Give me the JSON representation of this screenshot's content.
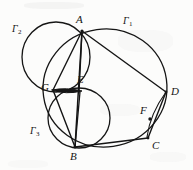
{
  "figure": {
    "kind": "euclidean-geometry-diagram",
    "background_color": "#fcfcfb",
    "stroke_color": "#151515",
    "width": 193,
    "height": 170,
    "points": {
      "A": {
        "x": 82,
        "y": 31,
        "label": "A",
        "label_x": 76,
        "label_y": 16
      },
      "B": {
        "x": 75,
        "y": 147,
        "label": "B",
        "label_x": 71,
        "label_y": 152
      },
      "C": {
        "x": 148,
        "y": 138,
        "label": "C",
        "label_x": 152,
        "label_y": 141
      },
      "D": {
        "x": 166,
        "y": 92,
        "label": "D",
        "label_x": 171,
        "label_y": 87
      },
      "E": {
        "x": 80,
        "y": 92,
        "label": "E",
        "label_x": 77,
        "label_y": 75
      },
      "F": {
        "x": 150,
        "y": 119,
        "label": "F",
        "label_x": 141,
        "label_y": 107
      },
      "G": {
        "x": 53,
        "y": 90,
        "label": "G",
        "label_x": 42,
        "label_y": 84
      }
    },
    "circles": {
      "Gamma1": {
        "cx": 105,
        "cy": 88,
        "rx": 62,
        "ry": 59,
        "rotation": -8,
        "label": "Γ",
        "subscript": "1",
        "label_x": 124,
        "label_y": 17
      },
      "Gamma2": {
        "cx": 56,
        "cy": 57,
        "rx": 34,
        "ry": 35,
        "rotation": 0,
        "label": "Γ",
        "subscript": "2",
        "label_x": 13,
        "label_y": 25
      },
      "Gamma3": {
        "cx": 79,
        "cy": 118,
        "rx": 31,
        "ry": 30,
        "rotation": 0,
        "label": "Γ",
        "subscript": "3",
        "label_x": 31,
        "label_y": 127
      }
    },
    "segments": [
      {
        "name": "A-B",
        "from": "A",
        "to": "B"
      },
      {
        "name": "A-D",
        "from": "A",
        "to": "D"
      },
      {
        "name": "A-G",
        "from": "A",
        "to": "G"
      },
      {
        "name": "A-E",
        "from": "A",
        "to": "E"
      },
      {
        "name": "B-G",
        "from": "B",
        "to": "G"
      },
      {
        "name": "B-E",
        "from": "B",
        "to": "E"
      },
      {
        "name": "B-C",
        "from": "B",
        "to": "C"
      },
      {
        "name": "C-D",
        "from": "C",
        "to": "D"
      },
      {
        "name": "G-E",
        "from": "G",
        "to": "E"
      }
    ],
    "marked_points": [
      "F"
    ],
    "caption": ""
  }
}
